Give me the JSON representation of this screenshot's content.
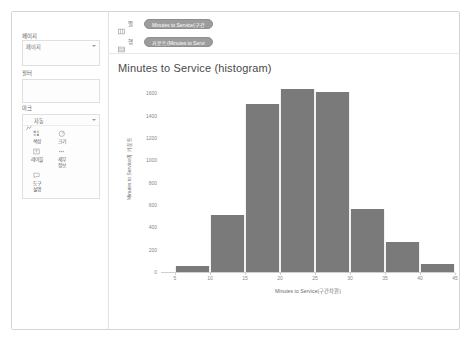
{
  "sidebar": {
    "pages": {
      "label": "페이지",
      "field_placeholder": "페이지",
      "dropdown_icon": "chevron-down-icon"
    },
    "filters": {
      "label": "필터"
    },
    "marks": {
      "label": "마크",
      "type_label": "자동",
      "type_icon": "marks-type-icon",
      "dropdown_icon": "chevron-down-icon",
      "buttons": [
        {
          "label": "색상",
          "icon": "color-icon"
        },
        {
          "label": "크기",
          "icon": "size-icon"
        },
        {
          "label": "레이블",
          "icon": "label-icon"
        },
        {
          "label": "세부\n정보",
          "icon": "detail-icon"
        },
        {
          "label": "도구\n설명",
          "icon": "tooltip-icon"
        }
      ]
    }
  },
  "shelves": [
    {
      "name": "열",
      "icon": "columns-icon",
      "pill": "Minutes to Service(구간"
    },
    {
      "name": "행",
      "icon": "rows-icon",
      "pill": "카운트(Minutes to Servi"
    }
  ],
  "chart_data": {
    "type": "bar",
    "title": "Minutes to Service (histogram)",
    "xlabel": "Minutes to Service(구간차원)",
    "ylabel": "Minutes to Service의 카운트",
    "grid": false,
    "legend": "none",
    "bar_color": "#7a7a7a",
    "xlim": [
      3,
      45
    ],
    "ylim": [
      0,
      1700
    ],
    "x_ticks": [
      5,
      10,
      15,
      20,
      25,
      30,
      35,
      40,
      45
    ],
    "y_ticks": [
      0,
      200,
      400,
      600,
      800,
      1000,
      1200,
      1400,
      1600
    ],
    "bin_width": 5,
    "categories": [
      "5",
      "10",
      "15",
      "20",
      "25",
      "30",
      "35",
      "40"
    ],
    "bin_starts": [
      5,
      10,
      15,
      20,
      25,
      30,
      35,
      40
    ],
    "values": [
      55,
      510,
      1500,
      1640,
      1610,
      560,
      270,
      75
    ]
  }
}
